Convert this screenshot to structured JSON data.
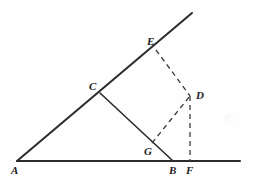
{
  "figure": {
    "background_color": "#fefefe",
    "stroke_color": "#2b2b2b",
    "dash_color": "#3a3a3a",
    "label_color": "#1c1c1c",
    "width": 253,
    "height": 188
  },
  "points": {
    "A": {
      "label": "A",
      "x": 17,
      "y": 161,
      "label_x": 11,
      "label_y": 165
    },
    "B": {
      "label": "B",
      "x": 173,
      "y": 161,
      "label_x": 169,
      "label_y": 165
    },
    "C": {
      "label": "C",
      "x": 100,
      "y": 93,
      "label_x": 89,
      "label_y": 81
    },
    "D": {
      "label": "D",
      "x": 190,
      "y": 96,
      "label_x": 196,
      "label_y": 90
    },
    "E": {
      "label": "E",
      "x": 156,
      "y": 50,
      "label_x": 147,
      "label_y": 36
    },
    "F": {
      "label": "F",
      "x": 190,
      "y": 161,
      "label_x": 186,
      "label_y": 165
    },
    "G": {
      "label": "G",
      "x": 152,
      "y": 143,
      "label_x": 144,
      "label_y": 146
    }
  },
  "segments": {
    "base_ray": {
      "name": "ray-AF-horizontal",
      "from": "A",
      "to_x": 240,
      "to_y": 161,
      "style": "solid"
    },
    "upper_ray": {
      "name": "ray-AE-oblique",
      "from": "A",
      "to_x": 192,
      "to_y": 13,
      "style": "solid"
    },
    "cb": {
      "name": "segment-CB",
      "from": "C",
      "to": "B",
      "style": "solid"
    },
    "ed": {
      "name": "segment-ED",
      "from": "E",
      "to": "D",
      "style": "dashed"
    },
    "gd": {
      "name": "segment-GD",
      "from": "G",
      "to": "D",
      "style": "dashed"
    },
    "df": {
      "name": "segment-DF",
      "from": "D",
      "to": "F",
      "style": "dashed"
    }
  },
  "watermark": {
    "text": "©"
  }
}
